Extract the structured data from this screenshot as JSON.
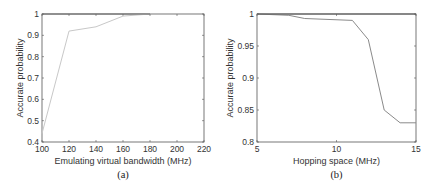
{
  "chart_data": [
    {
      "type": "line",
      "caption": "(a)",
      "title": "",
      "xlabel": "Emulating virtual bandwidth (MHz)",
      "ylabel": "Accurate probability",
      "xlim": [
        100,
        220
      ],
      "ylim": [
        0.4,
        1
      ],
      "xticks": [
        100,
        120,
        140,
        160,
        180,
        200,
        220
      ],
      "yticks": [
        0.4,
        0.5,
        0.6,
        0.7,
        0.8,
        0.9,
        1
      ],
      "ytick_labels": [
        "0.4",
        "0.5",
        "0.6",
        "0.7",
        "0.8",
        "0.9",
        "1"
      ],
      "grid": false,
      "legend": null,
      "series": [
        {
          "name": "series-1",
          "color": "#c8c8c8",
          "x": [
            100,
            120,
            140,
            160,
            180
          ],
          "y": [
            0.44,
            0.92,
            0.94,
            0.99,
            1.0
          ]
        },
        {
          "name": "series-2",
          "color": "#666666",
          "x": [
            100,
            120,
            140,
            160,
            180
          ],
          "y": [
            1.0,
            1.0,
            1.0,
            1.0,
            1.0
          ]
        }
      ]
    },
    {
      "type": "line",
      "caption": "(b)",
      "title": "",
      "xlabel": "Hopping space (MHz)",
      "ylabel": "Accurate probability",
      "xlim": [
        5,
        15
      ],
      "ylim": [
        0.8,
        1
      ],
      "xticks": [
        5,
        10,
        15
      ],
      "yticks": [
        0.8,
        0.85,
        0.9,
        0.95,
        1
      ],
      "ytick_labels": [
        "0.8",
        "0.85",
        "0.9",
        "0.95",
        "1"
      ],
      "grid": false,
      "legend": null,
      "series": [
        {
          "name": "series-1",
          "color": "#8a8a8a",
          "x": [
            5,
            7,
            8,
            11,
            12,
            13,
            14,
            15
          ],
          "y": [
            1.0,
            0.998,
            0.993,
            0.99,
            0.96,
            0.85,
            0.83,
            0.83
          ]
        },
        {
          "name": "series-2",
          "color": "#555555",
          "x": [
            5,
            15
          ],
          "y": [
            1.0,
            1.0
          ]
        }
      ]
    }
  ]
}
